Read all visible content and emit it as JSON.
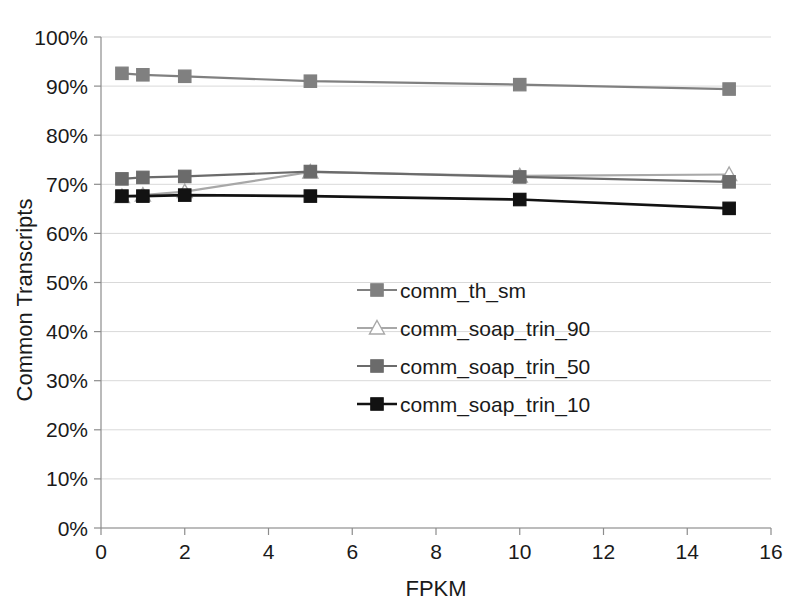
{
  "chart_data": {
    "type": "line",
    "title": "",
    "xlabel": "FPKM",
    "ylabel": "Common Transcripts",
    "xlim": [
      0,
      16
    ],
    "ylim": [
      0,
      100
    ],
    "x": [
      0.5,
      1,
      2,
      5,
      10,
      15
    ],
    "xticks": [
      0,
      2,
      4,
      6,
      8,
      10,
      12,
      14,
      16
    ],
    "xtick_labels": [
      "0",
      "2",
      "4",
      "6",
      "8",
      "10",
      "12",
      "14",
      "16"
    ],
    "yticks": [
      0,
      10,
      20,
      30,
      40,
      50,
      60,
      70,
      80,
      90,
      100
    ],
    "ytick_labels": [
      "0%",
      "10%",
      "20%",
      "30%",
      "40%",
      "50%",
      "60%",
      "70%",
      "80%",
      "90%",
      "100%"
    ],
    "grid": "horizontal",
    "legend_position": "center",
    "series": [
      {
        "name": "comm_th_sm",
        "values": [
          92.6,
          92.3,
          92.0,
          91.0,
          90.3,
          89.4
        ],
        "color": "#808080",
        "marker": "square",
        "marker_fill": "#808080",
        "line_width": 2.2
      },
      {
        "name": "comm_soap_trin_90",
        "values": [
          67.5,
          67.8,
          68.5,
          72.5,
          71.7,
          72.0
        ],
        "color": "#a8a8a8",
        "marker": "triangle-open",
        "marker_fill": "#ffffff",
        "line_width": 2.2
      },
      {
        "name": "comm_soap_trin_50",
        "values": [
          71.1,
          71.4,
          71.6,
          72.6,
          71.5,
          70.5
        ],
        "color": "#6b6b6b",
        "marker": "square",
        "marker_fill": "#6b6b6b",
        "line_width": 2.2
      },
      {
        "name": "comm_soap_trin_10",
        "values": [
          67.6,
          67.6,
          67.8,
          67.6,
          66.9,
          65.1
        ],
        "color": "#121212",
        "marker": "square",
        "marker_fill": "#121212",
        "line_width": 2.6
      }
    ]
  },
  "legend": {
    "entries": [
      {
        "label": "comm_th_sm"
      },
      {
        "label": "comm_soap_trin_90"
      },
      {
        "label": "comm_soap_trin_50"
      },
      {
        "label": "comm_soap_trin_10"
      }
    ]
  },
  "axes": {
    "x_title": "FPKM",
    "y_title": "Common Transcripts"
  },
  "colors": {
    "gridline": "#d9d9d9",
    "axis": "#8c8c8c",
    "text": "#1a1a1a",
    "background": "#ffffff"
  }
}
